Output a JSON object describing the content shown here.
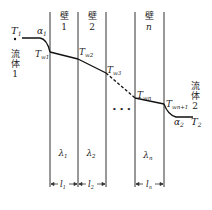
{
  "diagram": {
    "fluid_left": {
      "T": "T",
      "T_sub": "1",
      "alpha": "α",
      "alpha_sub": "1",
      "chars": [
        "流",
        "体",
        "1"
      ]
    },
    "fluid_right": {
      "T": "T",
      "T_sub": "2",
      "alpha": "α",
      "alpha_sub": "2",
      "chars": [
        "流",
        "体",
        "2"
      ]
    },
    "walls": [
      {
        "char": "壁",
        "num": "1",
        "lambda": "λ",
        "lambda_sub": "1",
        "l": "l",
        "l_sub": "1"
      },
      {
        "char": "壁",
        "num": "2",
        "lambda": "λ",
        "lambda_sub": "2",
        "l": "l",
        "l_sub": "2"
      },
      {
        "char": "壁",
        "num": "n",
        "lambda": "λ",
        "lambda_sub": "n",
        "l": "l",
        "l_sub": "n"
      }
    ],
    "wall_temps": [
      {
        "T": "T",
        "sub": "w1"
      },
      {
        "T": "T",
        "sub": "w2"
      },
      {
        "T": "T",
        "sub": "w3"
      },
      {
        "T": "T",
        "sub": "wn"
      },
      {
        "T": "T",
        "sub": "wn+1"
      }
    ],
    "ellipsis": "• • •",
    "colors": {
      "line": "#222222",
      "background": "#ffffff"
    }
  }
}
